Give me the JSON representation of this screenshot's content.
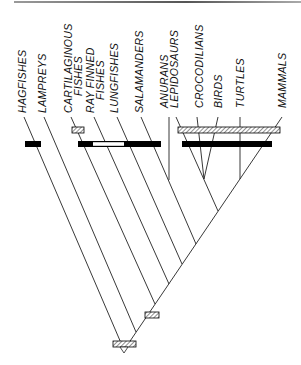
{
  "diagram": {
    "type": "cladogram",
    "taxa": [
      {
        "id": "hagfishes",
        "label": "HAGFISHES"
      },
      {
        "id": "lampreys",
        "label": "LAMPREYS"
      },
      {
        "id": "cartilaginous",
        "label": "CARTILAGINOUS",
        "label2": "FISHES"
      },
      {
        "id": "rayfinned",
        "label": "RAY FINNED",
        "label2": "FISHES"
      },
      {
        "id": "lungfishes",
        "label": "LUNGFISHES"
      },
      {
        "id": "salamanders",
        "label": "SALAMANDERS"
      },
      {
        "id": "anurans",
        "label": "ANURANS"
      },
      {
        "id": "lepidosaurs",
        "label": "LEPIDOSAURS"
      },
      {
        "id": "crocodilians",
        "label": "CROCODILIANS"
      },
      {
        "id": "birds",
        "label": "BIRDS"
      },
      {
        "id": "turtles",
        "label": "TURTLES"
      },
      {
        "id": "mammals",
        "label": "MAMMALS"
      }
    ],
    "character_bars": [
      {
        "name": "hagfish-black-bar",
        "fill": "black"
      },
      {
        "name": "rayfinned-black-white-bar",
        "fill": "black-white-black"
      },
      {
        "name": "cartilaginous-hatched-box",
        "fill": "hatched"
      },
      {
        "name": "amniote-hatched-bar",
        "fill": "hatched"
      },
      {
        "name": "amniote-black-bar",
        "fill": "black"
      },
      {
        "name": "gnathostome-hatched-box",
        "fill": "hatched"
      },
      {
        "name": "root-hatched-box",
        "fill": "hatched"
      }
    ],
    "colors": {
      "line": "#222222",
      "bar": "#000000",
      "background": "#ffffff"
    }
  }
}
